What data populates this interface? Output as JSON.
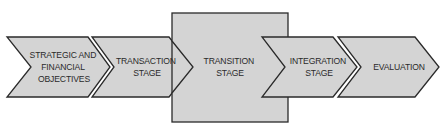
{
  "diagram": {
    "type": "process-flow",
    "colors": {
      "fill": "#d4d4d4",
      "stroke": "#2a2a2a",
      "text": "#2a2a2a",
      "background": "#ffffff"
    },
    "stages": [
      {
        "id": "strategic",
        "lines": [
          "STRATEGIC AND",
          "FINANCIAL",
          "OBJECTIVES"
        ]
      },
      {
        "id": "transaction",
        "lines": [
          "TRANSACTION",
          "STAGE"
        ]
      },
      {
        "id": "transition",
        "lines": [
          "TRANSITION",
          "STAGE"
        ]
      },
      {
        "id": "integration",
        "lines": [
          "INTEGRATION",
          "STAGE"
        ]
      },
      {
        "id": "evaluation",
        "lines": [
          "EVALUATION"
        ]
      }
    ]
  }
}
